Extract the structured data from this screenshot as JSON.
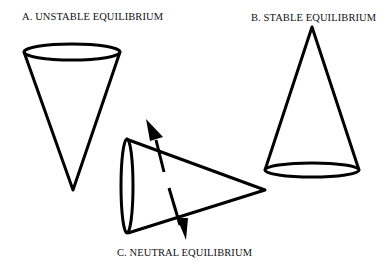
{
  "labels": {
    "a": "A.  UNSTABLE EQUILIBRIUM",
    "b": "B.  STABLE EQUILIBRIUM",
    "c": "C.  NEUTRAL EQUILIBRIUM"
  },
  "figures": [
    {
      "id": "A",
      "name": "cone-apex-down",
      "state": "unstable equilibrium"
    },
    {
      "id": "B",
      "name": "cone-apex-up",
      "state": "stable equilibrium"
    },
    {
      "id": "C",
      "name": "cone-on-side",
      "state": "neutral equilibrium"
    }
  ],
  "colors": {
    "stroke": "#000000",
    "background": "#ffffff"
  }
}
